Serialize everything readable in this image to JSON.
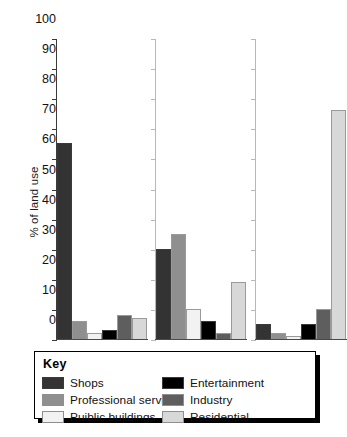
{
  "chart_data": {
    "type": "bar",
    "title": "",
    "xlabel": "",
    "ylabel": "% of land use",
    "ylim": [
      0,
      100
    ],
    "ytick_step": 10,
    "yticks": [
      100,
      90,
      80,
      70,
      60,
      50,
      40,
      30,
      20,
      10,
      0
    ],
    "grid": false,
    "legend_position": "below-plot",
    "legend_title": "Key",
    "categories": [
      "Group 1",
      "Group 2",
      "Group 3"
    ],
    "category_labels_shown": false,
    "series": [
      {
        "name": "Shops",
        "color": "#333333",
        "values": [
          65,
          30,
          5
        ]
      },
      {
        "name": "Professional services",
        "color": "#8f8f8f",
        "values": [
          6,
          35,
          2
        ]
      },
      {
        "name": "Puiblic buildings",
        "color": "#f2f2f2",
        "values": [
          2,
          10,
          1
        ]
      },
      {
        "name": "Entertainment",
        "color": "#000000",
        "values": [
          3,
          6,
          5
        ]
      },
      {
        "name": "Industry",
        "color": "#5e5e5e",
        "values": [
          8,
          2,
          10
        ]
      },
      {
        "name": "Residential",
        "color": "#d8d8d8",
        "values": [
          7,
          19,
          76
        ]
      }
    ]
  },
  "legend": {
    "title": "Key",
    "items": [
      {
        "label": "Shops",
        "color": "#333333"
      },
      {
        "label": "Entertainment",
        "color": "#000000"
      },
      {
        "label": "Professional services",
        "color": "#8f8f8f"
      },
      {
        "label": "Industry",
        "color": "#5e5e5e"
      },
      {
        "label": "Puiblic buildings",
        "color": "#f2f2f2"
      },
      {
        "label": "Residential",
        "color": "#d8d8d8"
      }
    ]
  }
}
